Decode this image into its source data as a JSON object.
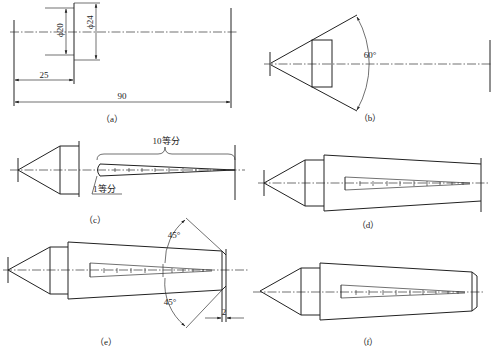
{
  "figure": {
    "line_color": "#222222",
    "background": "#ffffff"
  },
  "panels": {
    "a": {
      "caption": "（a）",
      "dims": {
        "d_small": "ϕ20",
        "d_large": "ϕ24",
        "len_short": "25",
        "len_total": "90"
      }
    },
    "b": {
      "caption": "（b）",
      "angle": "60°"
    },
    "c": {
      "caption": "（c）",
      "label_ten": "10等分",
      "label_one": "1等分"
    },
    "d": {
      "caption": "（d）"
    },
    "e": {
      "caption": "（e）",
      "angle_top": "45°",
      "angle_bottom": "45°",
      "dim_chamfer": "2"
    },
    "f": {
      "caption": "（f）"
    }
  }
}
